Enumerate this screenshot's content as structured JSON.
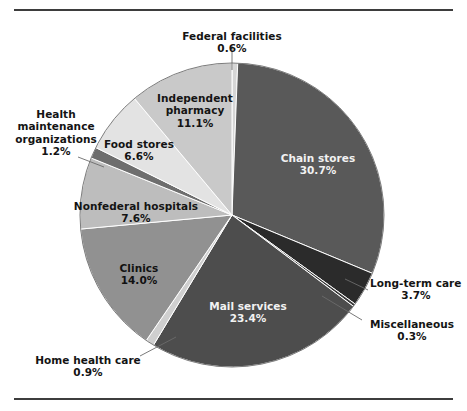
{
  "figure": {
    "has_top_rule": true,
    "has_bottom_rule": true,
    "rule_color": "#3d3d3d",
    "background": "#ffffff"
  },
  "chart_data": {
    "type": "pie",
    "title": "",
    "xlabel": "",
    "ylabel": "",
    "units": "percent",
    "start_angle_deg": 0,
    "direction": "clockwise",
    "legend": "none (labels placed on/around slices)",
    "grid": false,
    "categories": [
      "Federal facilities",
      "Chain stores",
      "Long-term care",
      "Miscellaneous",
      "Mail services",
      "Home health care",
      "Clinics",
      "Nonfederal hospitals",
      "Health maintenance organizations",
      "Food stores",
      "Independent pharmacy"
    ],
    "values": [
      0.6,
      30.7,
      3.7,
      0.3,
      23.4,
      0.9,
      14.0,
      7.6,
      1.2,
      6.6,
      11.1
    ],
    "value_labels": [
      "0.6%",
      "30.7%",
      "3.7%",
      "0.3%",
      "23.4%",
      "0.9%",
      "14.0%",
      "7.6%",
      "1.2%",
      "6.6%",
      "11.1%"
    ],
    "colors": [
      "#d6d6d6",
      "#595959",
      "#2b2b2b",
      "#3a3a3a",
      "#4d4d4d",
      "#cfcfcf",
      "#919191",
      "#bdbdbd",
      "#6e6e6e",
      "#e3e3e3",
      "#c9c9c9"
    ]
  },
  "labels": {
    "federal_facilities": {
      "name": "Federal facilities",
      "value": "0.6%"
    },
    "chain_stores": {
      "name": "Chain stores",
      "value": "30.7%"
    },
    "long_term_care": {
      "name": "Long-term care",
      "value": "3.7%"
    },
    "miscellaneous": {
      "name": "Miscellaneous",
      "value": "0.3%"
    },
    "mail_services": {
      "name": "Mail services",
      "value": "23.4%"
    },
    "home_health_care": {
      "name": "Home health care",
      "value": "0.9%"
    },
    "clinics": {
      "name": "Clinics",
      "value": "14.0%"
    },
    "nonfederal_hospitals": {
      "name": "Nonfederal hospitals",
      "value": "7.6%"
    },
    "hmo": {
      "name_line1": "Health",
      "name_line2": "maintenance",
      "name_line3": "organizations",
      "value": "1.2%"
    },
    "food_stores": {
      "name": "Food stores",
      "value": "6.6%"
    },
    "independent_pharmacy": {
      "name_line1": "Independent",
      "name_line2": "pharmacy",
      "value": "11.1%"
    }
  }
}
